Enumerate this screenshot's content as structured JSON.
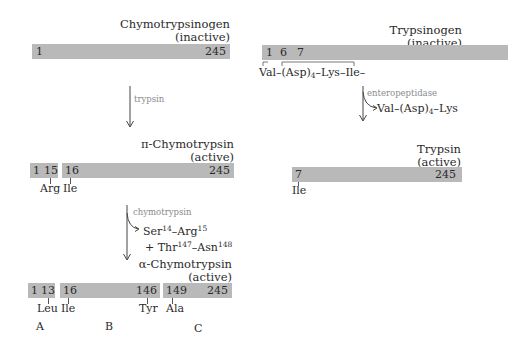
{
  "left": {
    "chymotrypsinogen": {
      "name": "Chymotrypsinogen",
      "state": "(inactive)",
      "start": "1",
      "end": "245"
    },
    "step1": {
      "enzyme": "trypsin"
    },
    "pi_chymotrypsin": {
      "name": "π-Chymotrypsin",
      "state": "(active)",
      "seg1_start": "1",
      "seg1_end": "15",
      "seg2_start": "16",
      "seg2_end": "245",
      "res_arg": "Arg",
      "res_ile": "Ile"
    },
    "step2": {
      "enzyme": "chymotrypsin",
      "product_line1_a": "Ser",
      "product_line1_a_sup": "14",
      "product_line1_b": "–Arg",
      "product_line1_b_sup": "15",
      "product_line2_a": "+ Thr",
      "product_line2_a_sup": "147",
      "product_line2_b": "–Asn",
      "product_line2_b_sup": "148"
    },
    "alpha_chymotrypsin": {
      "name": "α-Chymotrypsin",
      "state": "(active)",
      "segA_start": "1",
      "segA_end": "13",
      "segB_start": "16",
      "segB_end": "146",
      "segC_start": "149",
      "segC_end": "245",
      "res_leu": "Leu",
      "res_ile": "Ile",
      "res_tyr": "Tyr",
      "res_ala": "Ala",
      "chain_a": "A",
      "chain_b": "B",
      "chain_c": "C"
    }
  },
  "right": {
    "trypsinogen": {
      "name": "Trypsinogen",
      "state": "(inactive)",
      "n1": "1",
      "n6": "6",
      "n7": "7",
      "sequence_a": "Val–(Asp)",
      "sequence_sub": "4",
      "sequence_b": "–Lys–Ile–"
    },
    "step": {
      "enzyme": "enteropeptidase",
      "product_a": "Val–(Asp)",
      "product_sub": "4",
      "product_b": "–Lys"
    },
    "trypsin": {
      "name": "Trypsin",
      "state": "(active)",
      "start": "7",
      "end": "245",
      "res_ile": "Ile"
    }
  },
  "colors": {
    "bar": "#b9b9b9",
    "enzyme_text": "#8a8a8a",
    "text": "#2a2a2a"
  }
}
